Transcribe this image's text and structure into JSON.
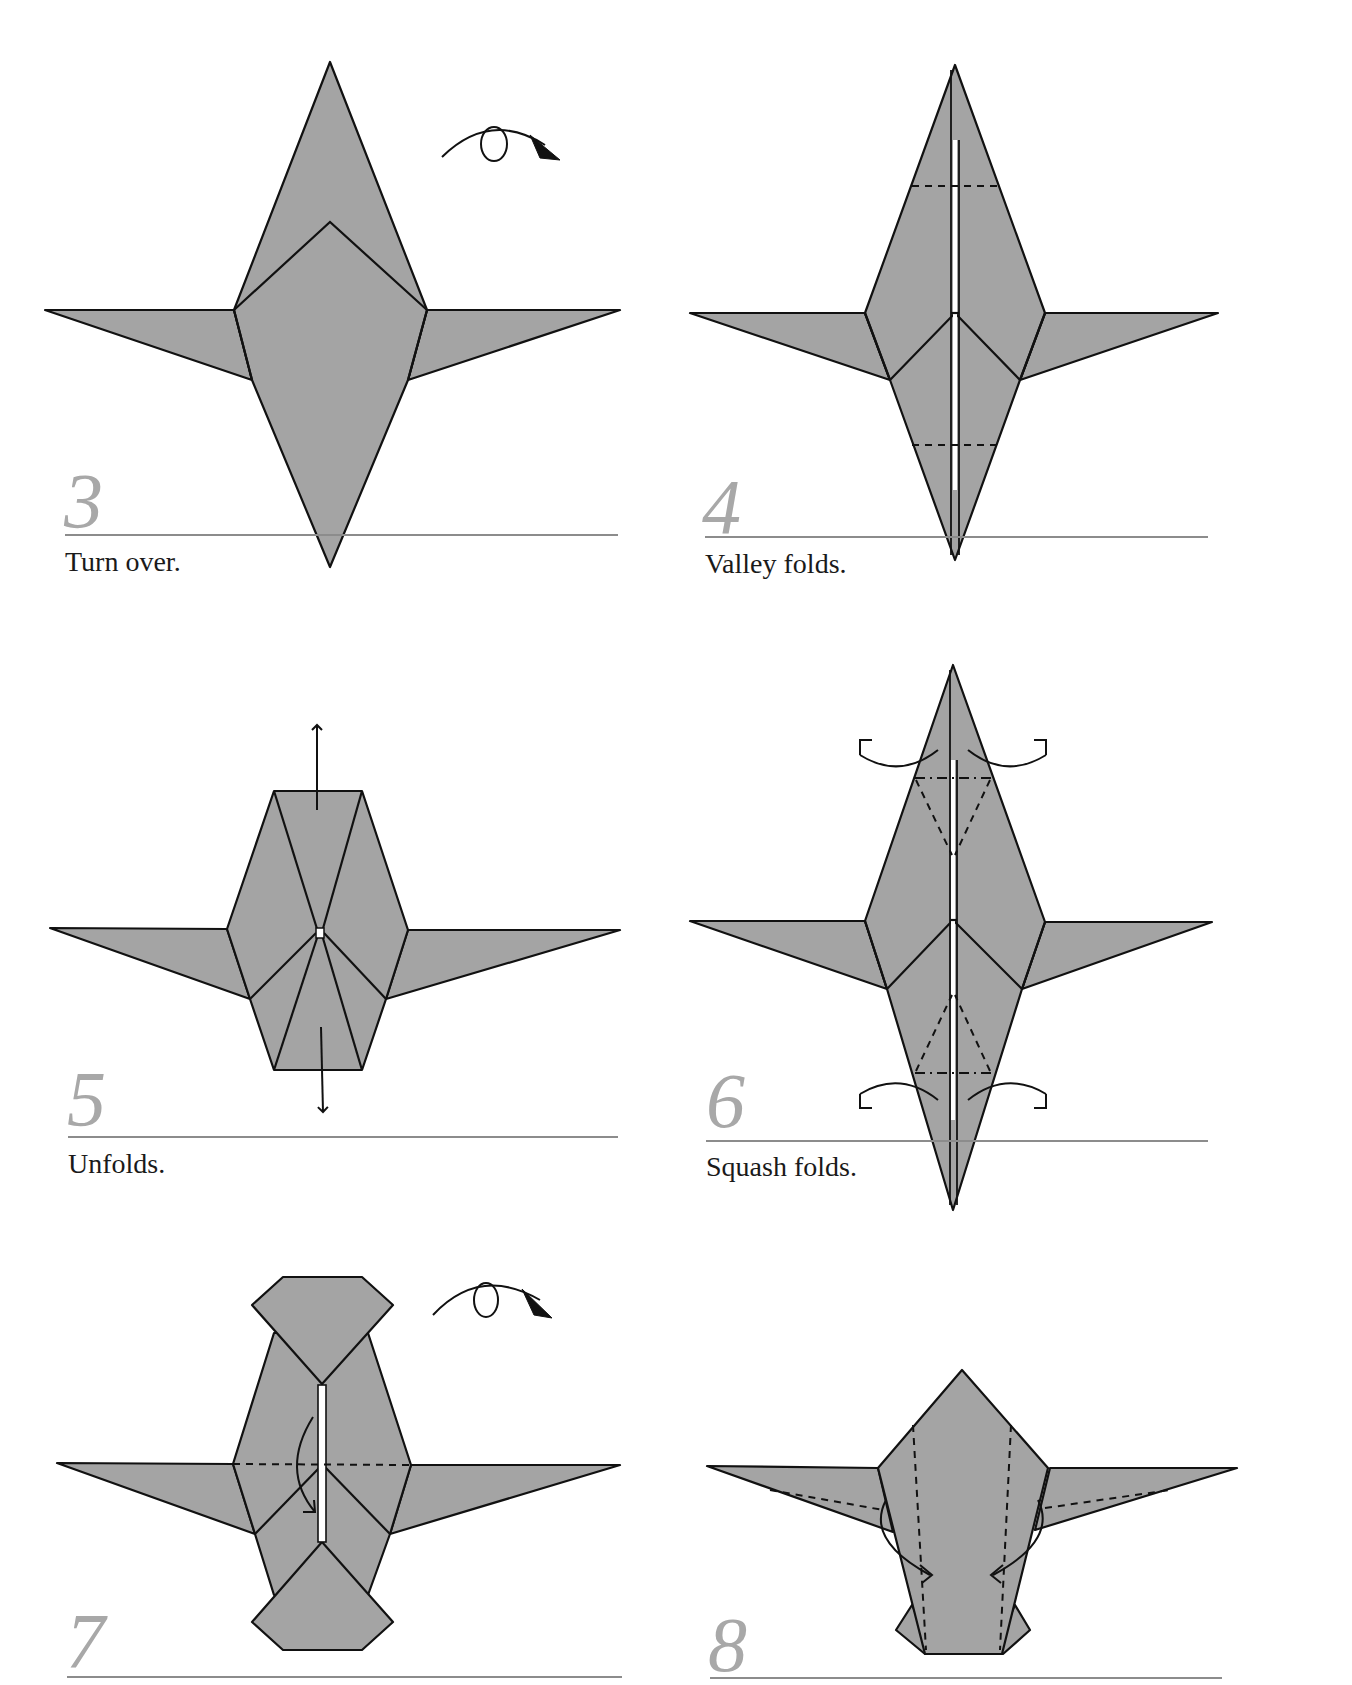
{
  "page": {
    "background": "#ffffff",
    "paper_color": "#a4a4a4",
    "line_color": "#111111",
    "step_number_color": "#a8a8a8",
    "rule_color": "#8c8c8c"
  },
  "steps": [
    {
      "number": "3",
      "caption": "Turn over.",
      "symbols": [
        "turn-over-arrow"
      ]
    },
    {
      "number": "4",
      "caption": "Valley folds.",
      "symbols": [
        "valley-fold-lines"
      ]
    },
    {
      "number": "5",
      "caption": "Unfolds.",
      "symbols": [
        "pull-out-arrow-up",
        "pull-out-arrow-down"
      ]
    },
    {
      "number": "6",
      "caption": "Squash folds.",
      "symbols": [
        "squash-fold-arrows",
        "mountain-fold-lines",
        "valley-fold-lines"
      ]
    },
    {
      "number": "7",
      "caption": "",
      "symbols": [
        "turn-over-arrow",
        "valley-fold-arrow",
        "valley-fold-line"
      ]
    },
    {
      "number": "8",
      "caption": "",
      "symbols": [
        "valley-fold-arrows",
        "valley-fold-lines"
      ]
    }
  ]
}
